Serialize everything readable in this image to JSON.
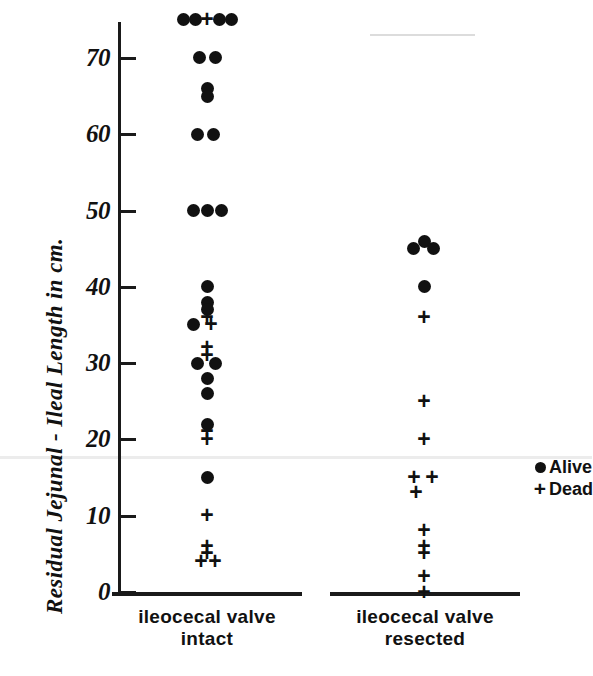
{
  "chart_data": {
    "type": "scatter",
    "title": "",
    "subtitle": "",
    "xlabel": "",
    "ylabel": "Residual  Jejunal - Ileal  Length  in  cm.",
    "ylim": [
      0,
      77
    ],
    "yticks": [
      0,
      10,
      20,
      30,
      40,
      50,
      60,
      70
    ],
    "ytick_labels": [
      "0",
      "10",
      "20",
      "30",
      "40",
      "50",
      "60",
      "70"
    ],
    "grid": false,
    "legend_position": "right",
    "categories": [
      "ileocecal valve intact",
      "ileocecal valve resected"
    ],
    "legend": [
      {
        "name": "Alive",
        "marker": "filled-circle"
      },
      {
        "name": "Dead",
        "marker": "plus"
      }
    ],
    "series": [
      {
        "name": "Alive",
        "marker": "filled-circle",
        "points": [
          {
            "group": "ileocecal valve intact",
            "value": 75,
            "offset": -24
          },
          {
            "group": "ileocecal valve intact",
            "value": 75,
            "offset": -12
          },
          {
            "group": "ileocecal valve intact",
            "value": 75,
            "offset": 12
          },
          {
            "group": "ileocecal valve intact",
            "value": 75,
            "offset": 24
          },
          {
            "group": "ileocecal valve intact",
            "value": 70,
            "offset": -8
          },
          {
            "group": "ileocecal valve intact",
            "value": 70,
            "offset": 8
          },
          {
            "group": "ileocecal valve intact",
            "value": 66,
            "offset": 0
          },
          {
            "group": "ileocecal valve intact",
            "value": 65,
            "offset": 0
          },
          {
            "group": "ileocecal valve intact",
            "value": 60,
            "offset": -10
          },
          {
            "group": "ileocecal valve intact",
            "value": 60,
            "offset": 6
          },
          {
            "group": "ileocecal valve intact",
            "value": 50,
            "offset": -14
          },
          {
            "group": "ileocecal valve intact",
            "value": 50,
            "offset": 0
          },
          {
            "group": "ileocecal valve intact",
            "value": 50,
            "offset": 14
          },
          {
            "group": "ileocecal valve intact",
            "value": 40,
            "offset": 0
          },
          {
            "group": "ileocecal valve intact",
            "value": 38,
            "offset": 0
          },
          {
            "group": "ileocecal valve intact",
            "value": 37,
            "offset": 0
          },
          {
            "group": "ileocecal valve intact",
            "value": 35,
            "offset": -14
          },
          {
            "group": "ileocecal valve intact",
            "value": 30,
            "offset": -10
          },
          {
            "group": "ileocecal valve intact",
            "value": 30,
            "offset": 8
          },
          {
            "group": "ileocecal valve intact",
            "value": 28,
            "offset": 0
          },
          {
            "group": "ileocecal valve intact",
            "value": 26,
            "offset": 0
          },
          {
            "group": "ileocecal valve intact",
            "value": 22,
            "offset": 0
          },
          {
            "group": "ileocecal valve intact",
            "value": 15,
            "offset": 0
          },
          {
            "group": "ileocecal valve resected",
            "value": 46,
            "offset": 0
          },
          {
            "group": "ileocecal valve resected",
            "value": 45,
            "offset": -11
          },
          {
            "group": "ileocecal valve resected",
            "value": 45,
            "offset": 9
          },
          {
            "group": "ileocecal valve resected",
            "value": 40,
            "offset": 0
          }
        ]
      },
      {
        "name": "Dead",
        "marker": "plus",
        "points": [
          {
            "group": "ileocecal valve intact",
            "value": 75,
            "offset": 0
          },
          {
            "group": "ileocecal valve intact",
            "value": 36,
            "offset": 0
          },
          {
            "group": "ileocecal valve intact",
            "value": 35,
            "offset": 4
          },
          {
            "group": "ileocecal valve intact",
            "value": 32,
            "offset": 0
          },
          {
            "group": "ileocecal valve intact",
            "value": 31,
            "offset": 0
          },
          {
            "group": "ileocecal valve intact",
            "value": 21,
            "offset": 0
          },
          {
            "group": "ileocecal valve intact",
            "value": 20,
            "offset": 0
          },
          {
            "group": "ileocecal valve intact",
            "value": 10,
            "offset": 0
          },
          {
            "group": "ileocecal valve intact",
            "value": 6,
            "offset": 0
          },
          {
            "group": "ileocecal valve intact",
            "value": 5,
            "offset": 0
          },
          {
            "group": "ileocecal valve intact",
            "value": 4,
            "offset": -6
          },
          {
            "group": "ileocecal valve intact",
            "value": 4,
            "offset": 8
          },
          {
            "group": "ileocecal valve resected",
            "value": 36,
            "offset": 0
          },
          {
            "group": "ileocecal valve resected",
            "value": 25,
            "offset": 0
          },
          {
            "group": "ileocecal valve resected",
            "value": 20,
            "offset": 0
          },
          {
            "group": "ileocecal valve resected",
            "value": 15,
            "offset": -10
          },
          {
            "group": "ileocecal valve resected",
            "value": 15,
            "offset": 8
          },
          {
            "group": "ileocecal valve resected",
            "value": 13,
            "offset": -8
          },
          {
            "group": "ileocecal valve resected",
            "value": 8,
            "offset": 0
          },
          {
            "group": "ileocecal valve resected",
            "value": 6,
            "offset": 0
          },
          {
            "group": "ileocecal valve resected",
            "value": 5,
            "offset": 0
          },
          {
            "group": "ileocecal valve resected",
            "value": 2,
            "offset": 0
          },
          {
            "group": "ileocecal valve resected",
            "value": 0,
            "offset": 0
          }
        ]
      }
    ]
  },
  "axis": {
    "y_title": "Residual  Jejunal - Ileal  Length  in  cm.",
    "tick_labels": [
      "70",
      "60",
      "50",
      "40",
      "30",
      "20",
      "10",
      "0"
    ]
  },
  "groups": [
    {
      "line1": "ileocecal  valve",
      "line2": "intact"
    },
    {
      "line1": "ileocecal  valve",
      "line2": "resected"
    }
  ],
  "legend": {
    "alive_label": "Alive",
    "dead_label": "Dead",
    "alive_marker": "●",
    "dead_marker": "+"
  },
  "colors": {
    "ink": "#111111",
    "background": "#ffffff"
  }
}
